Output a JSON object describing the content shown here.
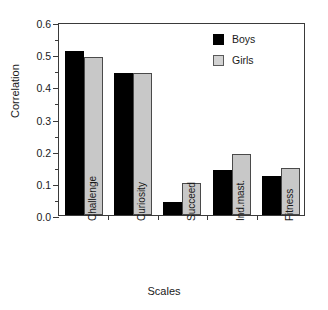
{
  "caption": {
    "text": ""
  },
  "legend": {
    "position": "top-right",
    "entries": [
      {
        "label": "Boys",
        "color": "#000000"
      },
      {
        "label": "Girls",
        "color": "#c8c8c8"
      }
    ]
  },
  "axes": {
    "ylabel": "Correlation",
    "xlabel": "Scales",
    "yticks": [
      "0.0",
      "0.1",
      "0.2",
      "0.3",
      "0.4",
      "0.5",
      "0.6"
    ]
  },
  "chart_data": {
    "type": "bar",
    "title": "",
    "xlabel": "Scales",
    "ylabel": "Correlation",
    "ylim": [
      0.0,
      0.6
    ],
    "ytick_step": 0.1,
    "yminor_step": 0.05,
    "grid": false,
    "legend_position": "top-right",
    "categories": [
      "Challenge",
      "Curiosity",
      "Succeed",
      "Ind.mast.",
      "Fitness"
    ],
    "series": [
      {
        "name": "Boys",
        "color": "#000000",
        "values": [
          0.51,
          0.44,
          0.04,
          0.14,
          0.12
        ]
      },
      {
        "name": "Girls",
        "color": "#c8c8c8",
        "values": [
          0.49,
          0.44,
          0.1,
          0.19,
          0.145
        ]
      }
    ]
  }
}
